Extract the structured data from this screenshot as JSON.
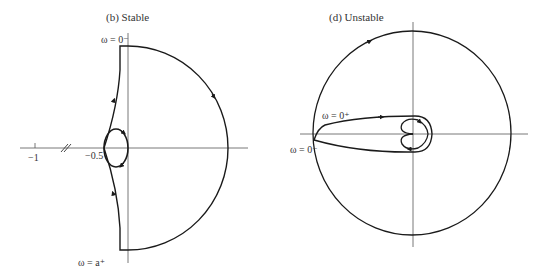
{
  "panel_b": {
    "title": "(b) Stable",
    "label_top": "ω = 0⁻",
    "label_bottom": "ω = a⁺",
    "tick_minus1": "−1",
    "tick_minus05": "−0.5"
  },
  "panel_d": {
    "title": "(d) Unstable",
    "label_0plus": "ω = 0⁺",
    "label_0minus": "ω = 0⁻"
  },
  "colors": {
    "curve": "#1a1a1a",
    "axis": "#555555"
  }
}
